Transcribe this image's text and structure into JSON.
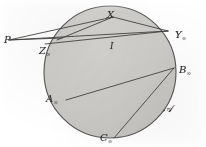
{
  "figure": {
    "kind": "geometric-diagram",
    "disk": {
      "center_x": 110,
      "center_y": 72,
      "radius": 66,
      "fill_color": "#cccbc8",
      "stroke_color": "#4a4a4a"
    },
    "line_color": "#3a3a3a",
    "background_color": "#ffffff",
    "points": [
      {
        "id": "P",
        "base": "P",
        "sub": "",
        "x": 9,
        "y": 40,
        "label_x": 4,
        "label_y": 30,
        "inside": false
      },
      {
        "id": "X",
        "base": "X",
        "sub": "",
        "x": 113,
        "y": 17,
        "label_x": 107,
        "label_y": 5,
        "inside": false
      },
      {
        "id": "Y_inf",
        "base": "Y",
        "sub": "∞",
        "x": 168,
        "y": 31,
        "label_x": 175,
        "label_y": 25,
        "inside": false
      },
      {
        "id": "Z_inf",
        "base": "Z",
        "sub": "∞",
        "x": 60,
        "y": 40,
        "label_x": 39,
        "label_y": 41,
        "inside": false
      },
      {
        "id": "B_inf",
        "base": "B",
        "sub": "∞",
        "x": 174,
        "y": 68,
        "label_x": 179,
        "label_y": 60,
        "inside": false
      },
      {
        "id": "A_inf",
        "base": "A",
        "sub": "∞",
        "x": 66,
        "y": 100,
        "label_x": 46,
        "label_y": 89,
        "inside": false
      },
      {
        "id": "C_inf",
        "base": "C",
        "sub": "∞",
        "x": 114,
        "y": 138,
        "label_x": 100,
        "label_y": 128,
        "inside": false
      },
      {
        "id": "script_A",
        "base": "𝒜",
        "sub": "",
        "x": 168,
        "y": 104,
        "label_x": 163,
        "label_y": 99,
        "inside": true
      },
      {
        "id": "I_center",
        "base": "I",
        "sub": "",
        "x": 113,
        "y": 44,
        "label_x": 110,
        "label_y": 36,
        "inside": true
      }
    ],
    "segments": [
      {
        "name": "P-to-X",
        "from": "P",
        "to": "X"
      },
      {
        "name": "P-to-Y",
        "from": "P",
        "to": "Y_inf"
      },
      {
        "name": "P-to-Z",
        "from": "P",
        "to": "Z_inf"
      },
      {
        "name": "X-to-Y",
        "from": "X",
        "to": "Y_inf"
      },
      {
        "name": "X-to-Z",
        "from": "X",
        "to": "Z_inf"
      },
      {
        "name": "chord-A-B",
        "from": "A_inf",
        "to": "B_inf"
      },
      {
        "name": "chord-C-B",
        "from": "C_inf",
        "to": "B_inf"
      },
      {
        "name": "chord-left-Y",
        "from": "Z_inf",
        "to": "Y_inf"
      }
    ]
  }
}
